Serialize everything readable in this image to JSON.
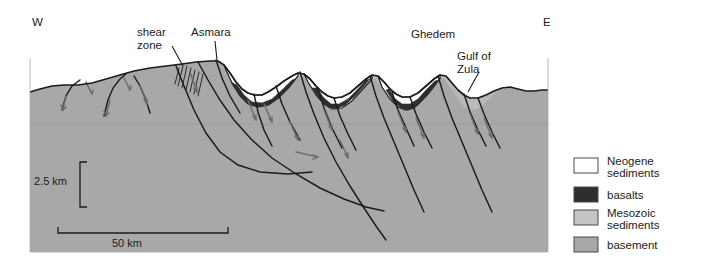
{
  "figure": {
    "kind": "geologic-cross-section",
    "background_color": "#ffffff",
    "section_panel": {
      "x": 30,
      "y": 58,
      "width": 518,
      "height": 194,
      "basement_color": "#a8a8a8",
      "mesozoic_color": "#b9b9b9",
      "basalt_color": "#2e2e2e",
      "neogene_color": "#ffffff",
      "outline_color": "#1b1b1b"
    }
  },
  "compass": {
    "west_label": "W",
    "west_x": 32,
    "west_y": 26,
    "east_label": "E",
    "east_x": 543,
    "east_y": 26
  },
  "annotations": [
    {
      "id": "shear-zone",
      "label_line_1": "shear",
      "label_line_2": "zone",
      "x": 137,
      "y": 36,
      "leader": [
        [
          172,
          46
        ],
        [
          183,
          66
        ]
      ]
    },
    {
      "id": "asmara",
      "label_line_1": "Asmara",
      "label_line_2": "",
      "x": 191,
      "y": 36,
      "leader": [
        [
          215,
          41
        ],
        [
          217,
          60
        ]
      ]
    },
    {
      "id": "ghedem",
      "label_line_1": "Ghedem",
      "label_line_2": "",
      "x": 411,
      "y": 38,
      "leader": []
    },
    {
      "id": "gulf-of-zula",
      "label_line_1": "Gulf of",
      "label_line_2": "Zula",
      "x": 457,
      "y": 60,
      "leader": [
        [
          479,
          72
        ],
        [
          468,
          92
        ]
      ]
    }
  ],
  "scale_bars": {
    "vertical": {
      "label": "2.5 km",
      "label_x": 34,
      "label_y": 185,
      "top_y": 162,
      "bottom_y": 207,
      "x": 80,
      "tick_len": 7
    },
    "horizontal": {
      "label": "50 km",
      "label_x": 112,
      "label_y": 247,
      "left_x": 58,
      "right_x": 228,
      "y": 233,
      "tick_len": 6
    }
  },
  "legend": {
    "box": {
      "x": 563,
      "y": 148,
      "width": 128,
      "height": 110,
      "fill": "#ffffff"
    },
    "items": [
      {
        "id": "neogene-sediments",
        "label_line_1": "Neogene",
        "label_line_2": "sediments",
        "swatch_color": "#ffffff"
      },
      {
        "id": "basalts",
        "label_line_1": "basalts",
        "label_line_2": "",
        "swatch_color": "#2e2e2e"
      },
      {
        "id": "mesozoic-sediments",
        "label_line_1": "Mesozoic",
        "label_line_2": "sediments",
        "swatch_color": "#c4c4c4"
      },
      {
        "id": "basement",
        "label_line_1": "basement",
        "label_line_2": "",
        "swatch_color": "#a8a8a8"
      }
    ]
  },
  "geometry": {
    "topography_path": "M30,92 L40,89 L52,86 L64,85 L78,85 L92,83 L106,79 L120,75 L134,71 L150,68 L166,66 L182,64 L196,62 L210,61 L218,61 L224,65 L230,73 L236,82 L242,89 L248,93 L254,95 L262,95 L268,92 L276,87 L284,81 L292,76 L298,73 L304,74 L310,79 L316,86 L322,92 L328,96 L334,98 L342,97 L350,93 L358,86 L366,79 L372,75 L378,76 L384,82 L390,89 L396,94 L402,97 L410,97 L418,93 L426,86 L434,79 L440,75 L446,76 L452,83 L458,90 L464,95 L470,98 L478,98 L486,95 L494,91 L502,88 L510,87 L518,89 L526,91 L534,91 L542,90 L548,90",
    "basement_top_path": "M30,92 L40,89 L52,86 L64,85 L78,85 L92,83 L106,79 L120,75 L134,71 L150,68 L166,66 L182,64 L196,62 L210,61 L218,61 L226,70 L236,86 L246,99 L256,106 L266,106 L276,100 L286,90 L296,80 L302,76 L308,82 L316,95 L324,104 L332,109 L342,108 L352,101 L362,90 L370,81 L376,79 L382,87 L390,99 L398,107 L406,110 L414,108 L422,100 L430,89 L438,80 L444,78 L450,87 L458,99 L464,107 L470,110 L478,109 L486,102 L494,94 L502,89 L510,87 L518,89 L526,91 L534,91 L542,90 L548,90",
    "basins": [
      {
        "id": "basin-asmara-east",
        "neogene_path": "M224,65 L230,73 L236,82 L242,89 L248,93 L254,95 L262,95 L268,92 L276,87 L284,81 L292,76 L298,73 L298,76 L288,88 L278,98 L268,105 L258,107 L248,104 L240,96 L232,83 L226,70 Z",
        "basalt_path": "M231,82 L240,96 L249,104 L259,107 L269,105 L279,98 L289,88 L296,79 L292,80 L282,90 L272,99 L262,103 L252,102 L244,95 L237,85 Z"
      },
      {
        "id": "basin-ghedem-west",
        "neogene_path": "M304,74 L310,79 L316,86 L322,92 L328,96 L334,98 L342,97 L350,93 L358,86 L366,79 L372,75 L372,79 L362,90 L352,101 L342,108 L332,109 L324,104 L316,95 L308,82 Z",
        "basalt_path": "M312,88 L320,100 L328,107 L336,109 L345,105 L355,96 L364,86 L370,79 L366,80 L357,90 L348,99 L339,104 L331,104 L323,97 L317,88 Z"
      },
      {
        "id": "basin-gulf-of-zula",
        "neogene_path": "M378,76 L384,82 L390,89 L396,94 L402,97 L410,97 L418,93 L426,86 L434,79 L440,75 L440,79 L430,89 L422,100 L414,108 L406,110 L398,107 L390,99 L382,87 Z",
        "basalt_path": "M386,90 L393,101 L401,108 L409,110 L418,105 L427,96 L435,86 L439,80 L435,81 L426,90 L418,99 L410,104 L402,104 L394,98 L389,89 Z"
      }
    ],
    "faults": [
      {
        "id": "fault-1",
        "d": "M62,110 L66,96 L72,86 L80,80"
      },
      {
        "id": "fault-2",
        "d": "M104,116 L108,100 L113,88 L120,79 L126,74"
      },
      {
        "id": "fault-3",
        "d": "M134,76 L140,86 L146,100 L150,113"
      },
      {
        "id": "fault-4",
        "d": "M176,66 L184,86 L194,110 L206,133 L220,152 L238,165 L260,172 L288,174 L312,172"
      },
      {
        "id": "fault-5",
        "d": "M198,62 L208,80 L220,100 L234,120 L252,140 L272,158 L296,174 L320,188 L344,199 L366,207 L384,211"
      },
      {
        "id": "fault-6",
        "d": "M216,60 L222,78 L230,96 L240,113"
      },
      {
        "id": "fault-7",
        "d": "M254,94 L258,112 L264,130 L272,146"
      },
      {
        "id": "fault-8",
        "d": "M276,86 L282,104 L290,122 L300,140"
      },
      {
        "id": "fault-9",
        "d": "M300,72 L306,92 L314,114 L324,138 L336,162 L350,186 L364,208 L376,226 L386,240"
      },
      {
        "id": "fault-10",
        "d": "M318,88 L324,108 L332,128 L342,148"
      },
      {
        "id": "fault-11",
        "d": "M334,98 L340,116 L348,134 L356,150"
      },
      {
        "id": "fault-12",
        "d": "M370,76 L376,96 L384,118 L394,142 L404,166 L414,190 L424,212"
      },
      {
        "id": "fault-13",
        "d": "M392,92 L398,110 L406,128 L414,146"
      },
      {
        "id": "fault-14",
        "d": "M410,97 L416,114 L424,132 L432,148"
      },
      {
        "id": "fault-15",
        "d": "M438,76 L444,96 L452,118 L462,142 L472,166 L482,190 L492,212"
      },
      {
        "id": "fault-16",
        "d": "M464,94 L470,112 L478,130 L486,146"
      },
      {
        "id": "fault-17",
        "d": "M478,98 L484,114 L492,132 L500,148"
      },
      {
        "id": "shear-zone-hatch",
        "d": "M183,66 L178,86 M187,66 L182,88 M191,68 L186,90 M195,70 L190,92 M199,72 L194,94 M203,74 L198,96 M179,68 L175,84"
      }
    ],
    "slip_arrows": [
      {
        "id": "arrow-1",
        "d": "M66,96 L63,110",
        "head": "M63,110 L61,105 M63,110 L66,107"
      },
      {
        "id": "arrow-2",
        "d": "M110,100 L106,116",
        "head": "M106,116 L104,111 M106,116 L109,113"
      },
      {
        "id": "arrow-3",
        "d": "M140,86 L147,104",
        "head": "M147,104 L144,100 M147,104 L147,99"
      },
      {
        "id": "arrow-4",
        "d": "M190,72 L197,92",
        "head": "M197,92 L194,88 M197,92 L197,87"
      },
      {
        "id": "arrow-5",
        "d": "M248,100 L256,120",
        "head": "M256,120 L253,116 M256,120 L256,115"
      },
      {
        "id": "arrow-6",
        "d": "M264,104 L272,122",
        "head": "M272,122 L269,118 M272,122 L272,117"
      },
      {
        "id": "arrow-7",
        "d": "M290,122 L298,140",
        "head": "M298,140 L295,136 M298,140 L298,135"
      },
      {
        "id": "arrow-8",
        "d": "M324,110 L332,130",
        "head": "M332,130 L329,126 M332,130 L332,125"
      },
      {
        "id": "arrow-9",
        "d": "M340,140 L348,158",
        "head": "M348,158 L345,154 M348,158 L348,153"
      },
      {
        "id": "arrow-10",
        "d": "M398,112 L406,132",
        "head": "M406,132 L403,128 M406,132 L406,127"
      },
      {
        "id": "arrow-11",
        "d": "M416,118 L424,138",
        "head": "M424,138 L421,134 M424,138 L424,133"
      },
      {
        "id": "arrow-12",
        "d": "M470,114 L478,134",
        "head": "M478,134 L475,130 M478,134 L478,129"
      },
      {
        "id": "arrow-13",
        "d": "M484,118 L492,138",
        "head": "M492,138 L489,134 M492,138 L492,133"
      },
      {
        "id": "arrow-14",
        "d": "M296,152 L318,157",
        "head": "M318,157 L313,155 M318,157 L313,159"
      },
      {
        "id": "arrow-15",
        "d": "M86,82 L92,94",
        "head": "M92,94 L90,90 M92,94 L93,90"
      },
      {
        "id": "arrow-16",
        "d": "M124,78 L130,90",
        "head": "M130,90 L128,86 M130,90 L131,86"
      }
    ]
  }
}
